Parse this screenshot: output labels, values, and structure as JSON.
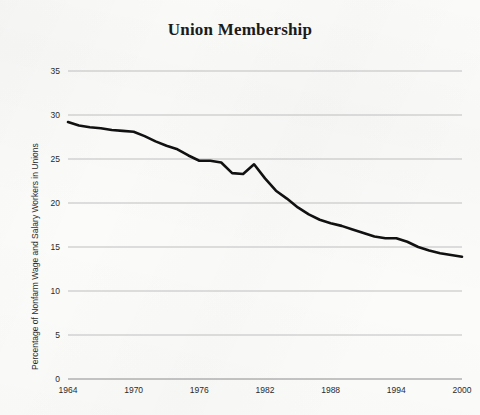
{
  "chart_data": {
    "type": "line",
    "title": "Union Membership",
    "xlabel": "",
    "ylabel": "Percentage of Nonfarm Wage and Salary Workers in Unions",
    "xlim": [
      1964,
      2000
    ],
    "ylim": [
      0,
      35
    ],
    "grid": "horizontal",
    "legend": "none",
    "line_color": "#111111",
    "grid_color": "#b8b8b8",
    "background_color": "#fbfbfa",
    "text_color": "#1b1b1b",
    "yticks": [
      0,
      5,
      10,
      15,
      20,
      25,
      30,
      35
    ],
    "ytick_labels": [
      "0",
      "5",
      "10",
      "15",
      "20",
      "25",
      "30",
      "35"
    ],
    "xticks": [
      1964,
      1970,
      1976,
      1982,
      1988,
      1994,
      2000
    ],
    "xtick_labels": [
      "1964",
      "1970",
      "1976",
      "1982",
      "1988",
      "1994",
      "2000"
    ],
    "series": [
      {
        "name": "Percentage of Nonfarm Wage and Salary Workers in Unions",
        "x": [
          1964,
          1965,
          1966,
          1967,
          1968,
          1969,
          1970,
          1971,
          1972,
          1973,
          1974,
          1975,
          1976,
          1977,
          1978,
          1979,
          1980,
          1981,
          1982,
          1983,
          1984,
          1985,
          1986,
          1987,
          1988,
          1989,
          1990,
          1991,
          1992,
          1993,
          1994,
          1995,
          1996,
          1997,
          1998,
          1999,
          2000
        ],
        "y": [
          29.2,
          28.8,
          28.6,
          28.5,
          28.3,
          28.2,
          28.1,
          27.6,
          27.0,
          26.5,
          26.1,
          25.4,
          24.8,
          24.8,
          24.6,
          23.4,
          23.3,
          24.4,
          22.8,
          21.4,
          20.5,
          19.5,
          18.7,
          18.1,
          17.7,
          17.4,
          17.0,
          16.6,
          16.2,
          16.0,
          16.0,
          15.6,
          15.0,
          14.6,
          14.3,
          14.1,
          13.9
        ]
      }
    ]
  },
  "axis": {
    "y_title": "Percentage of Nonfarm Wage and Salary Workers in Unions"
  }
}
